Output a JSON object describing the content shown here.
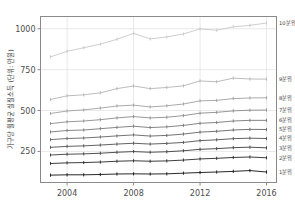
{
  "chart_data": {
    "type": "line",
    "title": "",
    "xlabel": "",
    "ylabel": "가구당 월평균 실질소득 (단위: 만원)",
    "xlim": [
      2002.4,
      2016.6
    ],
    "ylim": [
      60,
      1075
    ],
    "xticks": [
      2004,
      2008,
      2012,
      2016
    ],
    "xticklabels": [
      "2004",
      "2008",
      "2012",
      "2016"
    ],
    "yticks": [
      250,
      500,
      750,
      1000
    ],
    "yticklabels": [
      "250",
      "500",
      "750",
      "1000"
    ],
    "grid": true,
    "legend_position": "right-inline-labels",
    "x": [
      2003,
      2004,
      2005,
      2006,
      2007,
      2008,
      2009,
      2010,
      2011,
      2012,
      2013,
      2014,
      2015,
      2016
    ],
    "series": [
      {
        "name": "10분위",
        "label": "10분위",
        "color": "#c8c8c8",
        "values": [
          828,
          862,
          884,
          906,
          936,
          972,
          938,
          950,
          968,
          999,
          991,
          1012,
          1021,
          1035
        ]
      },
      {
        "name": "9분위",
        "label": "9분위",
        "color": "#b4b4b4",
        "values": [
          568,
          590,
          596,
          608,
          634,
          650,
          634,
          641,
          651,
          681,
          676,
          698,
          693,
          692
        ]
      },
      {
        "name": "8분위",
        "label": "8분위",
        "color": "#a0a0a0",
        "values": [
          482,
          497,
          504,
          515,
          528,
          533,
          522,
          529,
          540,
          559,
          562,
          573,
          577,
          578
        ]
      },
      {
        "name": "7분위",
        "label": "7분위",
        "color": "#8c8c8c",
        "values": [
          420,
          431,
          436,
          444,
          455,
          463,
          455,
          459,
          469,
          484,
          489,
          498,
          502,
          503
        ]
      },
      {
        "name": "6분위",
        "label": "6분위",
        "color": "#787878",
        "values": [
          369,
          378,
          381,
          389,
          397,
          404,
          396,
          400,
          409,
          422,
          427,
          436,
          440,
          440
        ]
      },
      {
        "name": "5분위",
        "label": "5분위",
        "color": "#646464",
        "values": [
          322,
          329,
          332,
          338,
          345,
          351,
          344,
          348,
          356,
          368,
          373,
          381,
          385,
          384
        ]
      },
      {
        "name": "4분위",
        "label": "4분위",
        "color": "#505050",
        "values": [
          275,
          281,
          284,
          289,
          295,
          300,
          295,
          299,
          305,
          316,
          321,
          328,
          331,
          329
        ]
      },
      {
        "name": "3분위",
        "label": "3분위",
        "color": "#3c3c3c",
        "values": [
          228,
          233,
          235,
          239,
          245,
          249,
          245,
          248,
          254,
          263,
          267,
          273,
          276,
          272
        ]
      },
      {
        "name": "2분위",
        "label": "2분위",
        "color": "#282828",
        "values": [
          176,
          180,
          182,
          185,
          190,
          193,
          190,
          192,
          197,
          204,
          208,
          213,
          216,
          211
        ]
      },
      {
        "name": "1분위",
        "label": "1분위",
        "color": "#111111",
        "values": [
          105,
          107,
          107,
          109,
          112,
          113,
          112,
          113,
          117,
          121,
          124,
          128,
          133,
          124
        ]
      }
    ]
  },
  "axes": {
    "frame_color": "#8a8a8a",
    "grid_color": "#e3e3e3",
    "background": "#ffffff"
  }
}
